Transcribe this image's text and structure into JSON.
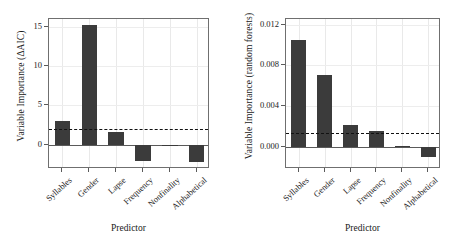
{
  "figure": {
    "panel_count": 2,
    "bar_color": "#3b3b3b",
    "frame_color": "#6f6f6f",
    "threshold_color": "#111111"
  },
  "chart_data": [
    {
      "type": "bar",
      "panel": "left",
      "title": "",
      "xlabel": "Predictor",
      "ylabel": "Variable Importance (ΔAIC)",
      "categories": [
        "Syllables",
        "Gender",
        "Lapse",
        "Frequency",
        "Nonfinality",
        "Alphabetical"
      ],
      "values": [
        3.0,
        15.3,
        1.6,
        -2.1,
        0.0,
        -2.2
      ],
      "yticks": [
        0,
        5,
        10,
        15
      ],
      "yticklabels": [
        "0",
        "5",
        "10",
        "15"
      ],
      "ylim": [
        -3.1,
        16.0
      ],
      "threshold": 2.0,
      "threshold_style": "dashed",
      "grid": true,
      "legend": "none"
    },
    {
      "type": "bar",
      "panel": "right",
      "title": "",
      "xlabel": "Predictor",
      "ylabel": "Variable Importance (random forests)",
      "categories": [
        "Syllables",
        "Gender",
        "Lapse",
        "Frequency",
        "Nonfinality",
        "Alphabetical"
      ],
      "values": [
        0.0105,
        0.007,
        0.0021,
        0.0015,
        0.0001,
        -0.001
      ],
      "yticks": [
        0.0,
        0.004,
        0.008,
        0.012
      ],
      "yticklabels": [
        "0.000",
        "0.004",
        "0.008",
        "0.012"
      ],
      "ylim": [
        -0.0022,
        0.01255
      ],
      "threshold": 0.0013,
      "threshold_style": "dashed",
      "grid": true,
      "legend": "none"
    }
  ]
}
